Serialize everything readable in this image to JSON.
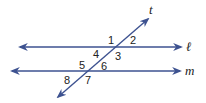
{
  "diagram": {
    "type": "parallel-lines-transversal",
    "line_color": "#3d5290",
    "text_color": "#222222",
    "lines": [
      {
        "name": "l",
        "label": "ℓ",
        "x1": 20,
        "y1": 47,
        "x2": 181,
        "y2": 47,
        "label_x": 186,
        "label_y": 51
      },
      {
        "name": "m",
        "label": "m",
        "x1": 12,
        "y1": 71,
        "x2": 180,
        "y2": 71,
        "label_x": 185,
        "label_y": 75
      }
    ],
    "transversal": {
      "name": "t",
      "label": "t",
      "x1": 58,
      "y1": 97,
      "x2": 148,
      "y2": 19,
      "label_x": 149,
      "label_y": 14
    },
    "angles": [
      {
        "label": "1",
        "x": 108,
        "y": 44
      },
      {
        "label": "2",
        "x": 130,
        "y": 44
      },
      {
        "label": "3",
        "x": 115,
        "y": 60
      },
      {
        "label": "4",
        "x": 93,
        "y": 58
      },
      {
        "label": "5",
        "x": 79,
        "y": 69
      },
      {
        "label": "6",
        "x": 101,
        "y": 70
      },
      {
        "label": "7",
        "x": 85,
        "y": 84
      },
      {
        "label": "8",
        "x": 64,
        "y": 84
      }
    ]
  }
}
